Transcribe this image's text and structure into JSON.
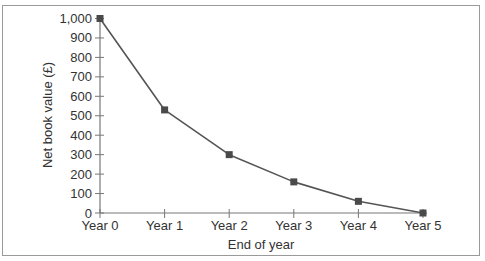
{
  "chart_data": {
    "type": "line",
    "title": "",
    "xlabel": "End of year",
    "ylabel": "Net book value (£)",
    "categories": [
      "Year 0",
      "Year 1",
      "Year 2",
      "Year 3",
      "Year 4",
      "Year 5"
    ],
    "series": [
      {
        "name": "Net book value",
        "values": [
          1000,
          530,
          300,
          160,
          60,
          0
        ]
      }
    ],
    "ylim": [
      0,
      1000
    ],
    "yticks": [
      0,
      100,
      200,
      300,
      400,
      500,
      600,
      700,
      800,
      900,
      1000
    ],
    "ytick_labels": [
      "0",
      "100",
      "200",
      "300",
      "400",
      "500",
      "600",
      "700",
      "800",
      "900",
      "1,000"
    ],
    "grid": false,
    "legend": "none",
    "marker": "square",
    "colors": {
      "line": "#555555",
      "marker": "#4a4a4a",
      "axis": "#777777",
      "frame": "#9a9a9a"
    }
  }
}
